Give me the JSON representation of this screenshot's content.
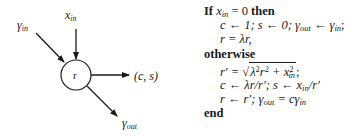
{
  "diagram": {
    "node_label": "r",
    "inputs": [
      {
        "name": "gamma",
        "subscript": "in",
        "symbol": "γ"
      },
      {
        "name": "x",
        "subscript": "in",
        "symbol": "x"
      }
    ],
    "outputs": [
      {
        "name": "cs",
        "text": "(c, s)"
      },
      {
        "name": "gamma",
        "subscript": "out",
        "symbol": "γ"
      }
    ]
  },
  "algorithm": {
    "line1": {
      "kw_if": "If",
      "expr": "x",
      "sub": "in",
      "rest": " = 0 ",
      "kw_then": "then"
    },
    "line2": "c ← 1;  s ← 0;  γ",
    "line2_sub_out": "out",
    "line2_mid": " ← γ",
    "line2_sub_in": "in",
    "line2_end": ";",
    "line3": "r = λr,",
    "line4_kw": "otherwise",
    "line5_lhs": "r′ = ",
    "line5_sqrt": "λ²r² + x²",
    "line5_sqrt_parts": {
      "a": "λ",
      "a_sup": "2",
      "b": "r",
      "b_sup": "2",
      "plus": " + x",
      "c_sup": "2",
      "c_sub": "in"
    },
    "line5_end": ";",
    "line6": "c ← λr/r′;  s ← x",
    "line6_sub": "in",
    "line6_end": "/r′",
    "line7": "r ← r′;  γ",
    "line7_sub_out": "out",
    "line7_mid": " = cγ",
    "line7_sub_in": "in",
    "line8_kw": "end"
  }
}
